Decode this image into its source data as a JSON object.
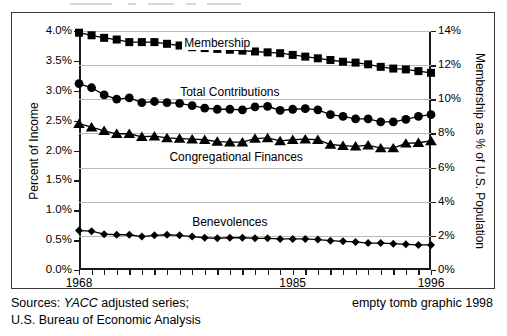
{
  "chart_data": {
    "type": "line",
    "title": "",
    "subtitle": "",
    "xlabel": "",
    "ylabel": "Percent of Income",
    "ylabel_right": "Membership as % of U.S. Population",
    "grid": true,
    "grid_axis": "right",
    "legend_position": "inline-annotations",
    "x": [
      1968,
      1969,
      1970,
      1971,
      1972,
      1973,
      1974,
      1975,
      1976,
      1977,
      1978,
      1979,
      1980,
      1981,
      1982,
      1983,
      1984,
      1985,
      1986,
      1987,
      1988,
      1989,
      1990,
      1991,
      1992,
      1993,
      1994,
      1995,
      1996
    ],
    "xlim": [
      1968,
      1996
    ],
    "xtick_labels": [
      "1968",
      "1985",
      "1996"
    ],
    "xtick_values": [
      1968,
      1985,
      1996
    ],
    "ylim": [
      0.0,
      4.0
    ],
    "ytick_labels": [
      "0.0%",
      "0.5%",
      "1.0%",
      "1.5%",
      "2.0%",
      "2.5%",
      "3.0%",
      "3.5%",
      "4.0%"
    ],
    "ytick_values": [
      0.0,
      0.5,
      1.0,
      1.5,
      2.0,
      2.5,
      3.0,
      3.5,
      4.0
    ],
    "ylim_right": [
      0,
      14
    ],
    "ytick_labels_right": [
      "0%",
      "2%",
      "4%",
      "6%",
      "8%",
      "10%",
      "12%",
      "14%"
    ],
    "ytick_values_right": [
      0,
      2,
      4,
      6,
      8,
      10,
      12,
      14
    ],
    "series": [
      {
        "name": "Membership",
        "axis": "right",
        "marker": "square",
        "annotation": "Membership",
        "annot_x": 1979.0,
        "annot_y_pct": 3.78,
        "values": [
          13.9,
          13.75,
          13.6,
          13.5,
          13.35,
          13.35,
          13.35,
          13.25,
          13.15,
          13.05,
          13.0,
          12.95,
          12.9,
          12.85,
          12.8,
          12.75,
          12.7,
          12.6,
          12.5,
          12.4,
          12.3,
          12.2,
          12.15,
          12.05,
          11.9,
          11.8,
          11.75,
          11.65,
          11.55
        ]
      },
      {
        "name": "Total Contributions",
        "axis": "left",
        "marker": "circle",
        "annotation": "Total Contributions",
        "annot_x": 1980.0,
        "annot_y_pct": 2.97,
        "values": [
          3.12,
          3.05,
          2.93,
          2.86,
          2.88,
          2.8,
          2.82,
          2.8,
          2.79,
          2.75,
          2.71,
          2.69,
          2.69,
          2.68,
          2.73,
          2.74,
          2.67,
          2.69,
          2.7,
          2.68,
          2.6,
          2.57,
          2.53,
          2.53,
          2.48,
          2.48,
          2.52,
          2.57,
          2.6
        ]
      },
      {
        "name": "Congregational Finances",
        "axis": "left",
        "marker": "triangle",
        "annotation": "Congregational Finances",
        "annot_x": 1980.5,
        "annot_y_pct": 1.88,
        "values": [
          2.45,
          2.39,
          2.33,
          2.28,
          2.28,
          2.23,
          2.24,
          2.21,
          2.2,
          2.19,
          2.18,
          2.15,
          2.14,
          2.14,
          2.2,
          2.21,
          2.16,
          2.18,
          2.19,
          2.18,
          2.1,
          2.08,
          2.07,
          2.09,
          2.04,
          2.04,
          2.12,
          2.13,
          2.16
        ]
      },
      {
        "name": "Benevolences",
        "axis": "left",
        "marker": "diamond",
        "annotation": "Benevolences",
        "annot_x": 1980.0,
        "annot_y_pct": 0.78,
        "values": [
          0.66,
          0.65,
          0.6,
          0.59,
          0.59,
          0.56,
          0.58,
          0.59,
          0.58,
          0.56,
          0.54,
          0.53,
          0.54,
          0.54,
          0.53,
          0.53,
          0.52,
          0.52,
          0.52,
          0.51,
          0.49,
          0.48,
          0.47,
          0.45,
          0.45,
          0.44,
          0.43,
          0.42,
          0.42
        ]
      }
    ],
    "colors": {
      "series": "#000000",
      "gridline": "#b9b9b9",
      "axis": "#1a1a1a",
      "background": "#ffffff",
      "frame": "#3a3a3a"
    }
  },
  "footer": {
    "sources_prefix": "Sources: ",
    "sources_italic": "YACC",
    "sources_suffix": " adjusted series;",
    "sources_line2": "U.S. Bureau of Economic Analysis",
    "credit": "empty tomb graphic 1998"
  }
}
